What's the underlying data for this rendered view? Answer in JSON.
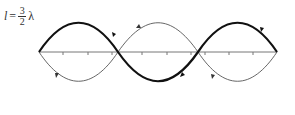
{
  "label": {
    "variable": "l",
    "equals": "=",
    "numerator": "3",
    "denominator": "2",
    "symbol": "λ"
  },
  "diagram": {
    "axis_y": 52,
    "x_start": 39,
    "x_end": 277,
    "amplitude": 39,
    "half_wavelengths": 3,
    "colors": {
      "thick_curve": "#111111",
      "thin_curve": "#555555",
      "axis": "#777777"
    }
  }
}
